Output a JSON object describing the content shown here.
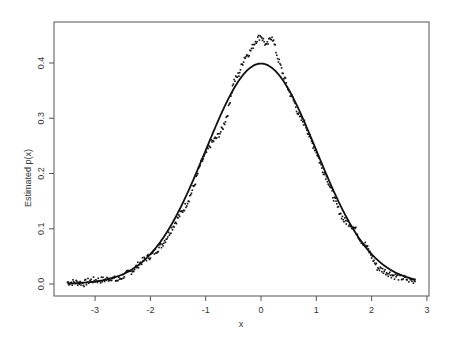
{
  "chart_data": {
    "type": "line",
    "title": "",
    "xlabel": "x",
    "ylabel": "Estimated p(x)",
    "xlim": [
      -3.6,
      3.05
    ],
    "ylim": [
      -0.02,
      0.475
    ],
    "x_ticks": [
      -3,
      -2,
      -1,
      0,
      1,
      2,
      3
    ],
    "x_tick_labels": [
      "-3",
      "-2",
      "-1",
      "0",
      "1",
      "2",
      "3"
    ],
    "y_ticks": [
      0.0,
      0.1,
      0.2,
      0.3,
      0.4
    ],
    "y_tick_labels": [
      "0.0",
      "0.1",
      "0.2",
      "0.3",
      "0.4"
    ],
    "grid": false,
    "legend": null,
    "series": [
      {
        "name": "True density (standard normal)",
        "style": "solid-line",
        "function": "normal_pdf",
        "mean": 0,
        "sd": 1,
        "x_range": [
          -3.5,
          2.8
        ]
      },
      {
        "name": "Estimated density",
        "style": "points",
        "x": [
          -3.5,
          -3.4,
          -3.3,
          -3.2,
          -3.1,
          -3.0,
          -2.9,
          -2.8,
          -2.7,
          -2.6,
          -2.5,
          -2.4,
          -2.3,
          -2.2,
          -2.1,
          -2.0,
          -1.9,
          -1.8,
          -1.7,
          -1.6,
          -1.5,
          -1.4,
          -1.3,
          -1.2,
          -1.1,
          -1.0,
          -0.9,
          -0.8,
          -0.7,
          -0.6,
          -0.5,
          -0.4,
          -0.3,
          -0.2,
          -0.1,
          0.0,
          0.1,
          0.2,
          0.3,
          0.4,
          0.5,
          0.6,
          0.7,
          0.8,
          0.9,
          1.0,
          1.1,
          1.2,
          1.3,
          1.4,
          1.5,
          1.6,
          1.7,
          1.8,
          1.9,
          2.0,
          2.1,
          2.2,
          2.3,
          2.4,
          2.5,
          2.6,
          2.7,
          2.8
        ],
        "y": [
          0.003,
          0.003,
          0.003,
          0.001,
          0.006,
          0.007,
          0.007,
          0.008,
          0.012,
          0.006,
          0.014,
          0.02,
          0.026,
          0.037,
          0.045,
          0.051,
          0.06,
          0.07,
          0.085,
          0.103,
          0.12,
          0.135,
          0.155,
          0.18,
          0.215,
          0.235,
          0.255,
          0.265,
          0.28,
          0.31,
          0.365,
          0.38,
          0.41,
          0.42,
          0.44,
          0.45,
          0.43,
          0.45,
          0.41,
          0.38,
          0.35,
          0.33,
          0.3,
          0.29,
          0.26,
          0.24,
          0.21,
          0.19,
          0.16,
          0.135,
          0.115,
          0.11,
          0.1,
          0.08,
          0.07,
          0.05,
          0.03,
          0.025,
          0.02,
          0.015,
          0.012,
          0.01,
          0.007,
          0.006
        ]
      }
    ]
  },
  "axes": {
    "xlabel": "x",
    "ylabel": "Estimated p(x)"
  }
}
